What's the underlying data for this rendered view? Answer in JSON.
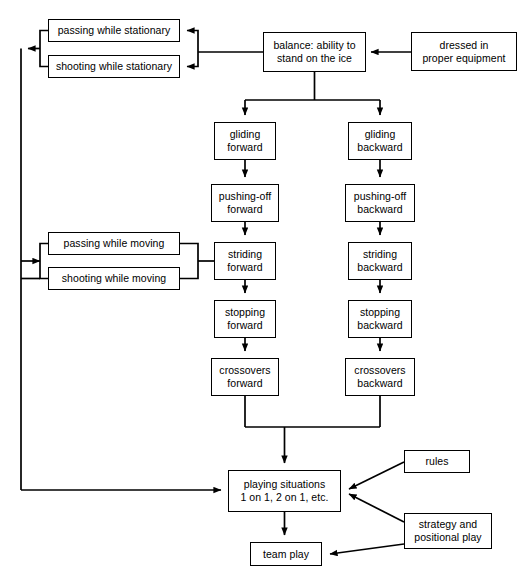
{
  "diagram": {
    "background_color": "#ffffff",
    "line_color": "#000000",
    "text_color": "#000000",
    "nodes": [
      {
        "id": "passing_stationary",
        "label": "passing while stationary",
        "x": 48,
        "y": 19,
        "w": 132,
        "h": 23
      },
      {
        "id": "shooting_stationary",
        "label": "shooting while stationary",
        "x": 48,
        "y": 55,
        "w": 132,
        "h": 23
      },
      {
        "id": "balance",
        "label": "balance: ability to\nstand on the ice",
        "x": 263,
        "y": 32,
        "w": 103,
        "h": 40
      },
      {
        "id": "dressed",
        "label": "dressed in\nproper equipment",
        "x": 411,
        "y": 32,
        "w": 106,
        "h": 39
      },
      {
        "id": "gliding_fwd",
        "label": "gliding\nforward",
        "x": 214,
        "y": 122,
        "w": 62,
        "h": 38
      },
      {
        "id": "gliding_bwd",
        "label": "gliding\nbackward",
        "x": 348,
        "y": 122,
        "w": 64,
        "h": 38
      },
      {
        "id": "pushing_fwd",
        "label": "pushing-off\nforward",
        "x": 211,
        "y": 184,
        "w": 68,
        "h": 38
      },
      {
        "id": "pushing_bwd",
        "label": "pushing-off\nbackward",
        "x": 345,
        "y": 184,
        "w": 70,
        "h": 38
      },
      {
        "id": "passing_moving",
        "label": "passing while moving",
        "x": 48,
        "y": 232,
        "w": 132,
        "h": 23
      },
      {
        "id": "shooting_moving",
        "label": "shooting while moving",
        "x": 48,
        "y": 267,
        "w": 132,
        "h": 23
      },
      {
        "id": "striding_fwd",
        "label": "striding\nforward",
        "x": 214,
        "y": 242,
        "w": 62,
        "h": 38
      },
      {
        "id": "striding_bwd",
        "label": "striding\nbackward",
        "x": 348,
        "y": 242,
        "w": 64,
        "h": 38
      },
      {
        "id": "stopping_fwd",
        "label": "stopping\nforward",
        "x": 214,
        "y": 300,
        "w": 62,
        "h": 38
      },
      {
        "id": "stopping_bwd",
        "label": "stopping\nbackward",
        "x": 348,
        "y": 300,
        "w": 64,
        "h": 38
      },
      {
        "id": "crossovers_fwd",
        "label": "crossovers\nforward",
        "x": 211,
        "y": 358,
        "w": 68,
        "h": 38
      },
      {
        "id": "crossovers_bwd",
        "label": "crossovers\nbackward",
        "x": 345,
        "y": 358,
        "w": 70,
        "h": 38
      },
      {
        "id": "playing_situations",
        "label": "playing situations\n1 on 1, 2 on 1, etc.",
        "x": 228,
        "y": 470,
        "w": 113,
        "h": 42
      },
      {
        "id": "rules",
        "label": "rules",
        "x": 404,
        "y": 450,
        "w": 66,
        "h": 23
      },
      {
        "id": "strategy",
        "label": "strategy and\npositional play",
        "x": 404,
        "y": 513,
        "w": 88,
        "h": 36
      },
      {
        "id": "team_play",
        "label": "team play",
        "x": 250,
        "y": 542,
        "w": 72,
        "h": 24
      }
    ],
    "edges": [
      {
        "id": "dressed-to-balance",
        "from": "dressed",
        "to": "balance"
      },
      {
        "id": "balance-to-passing-stationary",
        "from": "balance",
        "to": "passing_stationary"
      },
      {
        "id": "balance-to-shooting-stationary",
        "from": "balance",
        "to": "shooting_stationary"
      },
      {
        "id": "stationary-to-left-bus",
        "from": "stationary_group",
        "to": "left_bus"
      },
      {
        "id": "balance-to-gliding-forward",
        "from": "balance",
        "to": "gliding_fwd"
      },
      {
        "id": "balance-to-gliding-backward",
        "from": "balance",
        "to": "gliding_bwd"
      },
      {
        "id": "gliding-fwd-to-pushing-fwd",
        "from": "gliding_fwd",
        "to": "pushing_fwd"
      },
      {
        "id": "pushing-fwd-to-striding-fwd",
        "from": "pushing_fwd",
        "to": "striding_fwd"
      },
      {
        "id": "striding-fwd-to-stopping-fwd",
        "from": "striding_fwd",
        "to": "stopping_fwd"
      },
      {
        "id": "stopping-fwd-to-crossovers-fwd",
        "from": "stopping_fwd",
        "to": "crossovers_fwd"
      },
      {
        "id": "gliding-bwd-to-pushing-bwd",
        "from": "gliding_bwd",
        "to": "pushing_bwd"
      },
      {
        "id": "pushing-bwd-to-striding-bwd",
        "from": "pushing_bwd",
        "to": "striding_bwd"
      },
      {
        "id": "striding-bwd-to-stopping-bwd",
        "from": "striding_bwd",
        "to": "stopping_bwd"
      },
      {
        "id": "stopping-bwd-to-crossovers-bwd",
        "from": "stopping_bwd",
        "to": "crossovers_bwd"
      },
      {
        "id": "striding-fwd-to-moving-group",
        "from": "striding_fwd",
        "to": "moving_group"
      },
      {
        "id": "moving-to-left-bus",
        "from": "moving_group",
        "to": "left_bus"
      },
      {
        "id": "crossovers-to-playing",
        "from": "crossovers_group",
        "to": "playing_situations"
      },
      {
        "id": "left-bus-to-playing",
        "from": "left_bus",
        "to": "playing_situations"
      },
      {
        "id": "rules-to-playing",
        "from": "rules",
        "to": "playing_situations"
      },
      {
        "id": "strategy-to-playing",
        "from": "strategy",
        "to": "playing_situations"
      },
      {
        "id": "playing-to-team-play",
        "from": "playing_situations",
        "to": "team_play"
      },
      {
        "id": "strategy-to-team-play",
        "from": "strategy",
        "to": "team_play"
      }
    ]
  }
}
